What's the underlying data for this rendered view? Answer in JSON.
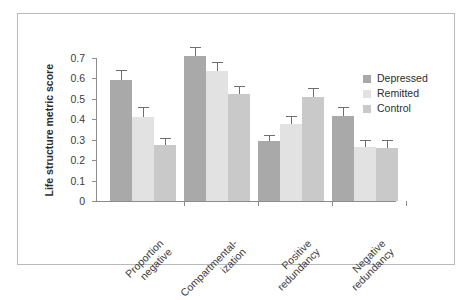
{
  "chart_data": {
    "type": "bar",
    "title": "",
    "xlabel": "",
    "ylabel": "Life structure metric score",
    "ylim": [
      0,
      0.75
    ],
    "grid": false,
    "legend_position": "right",
    "categories": [
      "Proportion negative",
      "Compartmental-ization",
      "Positive redundancy",
      "Negative redundancy"
    ],
    "category_lines": [
      [
        "Proportion",
        "negative"
      ],
      [
        "Compartmental-",
        "ization"
      ],
      [
        "Positive",
        "redundancy"
      ],
      [
        "Negative",
        "redundancy"
      ]
    ],
    "ytick_labels": [
      "0",
      "0.1",
      "0.2",
      "0.3",
      "0.4",
      "0.5",
      "0.6",
      "0.7"
    ],
    "ytick_values": [
      0,
      0.1,
      0.2,
      0.3,
      0.4,
      0.5,
      0.6,
      0.7
    ],
    "series": [
      {
        "name": "Depressed",
        "color": "#a9a9a9",
        "values": [
          0.59,
          0.71,
          0.295,
          0.415
        ],
        "errors": [
          0.045,
          0.04,
          0.025,
          0.04
        ]
      },
      {
        "name": "Remitted",
        "color": "#e2e2e2",
        "values": [
          0.41,
          0.635,
          0.375,
          0.265
        ],
        "errors": [
          0.045,
          0.04,
          0.035,
          0.03
        ]
      },
      {
        "name": "Control",
        "color": "#c9c9c9",
        "values": [
          0.275,
          0.525,
          0.51,
          0.26
        ],
        "errors": [
          0.03,
          0.035,
          0.04,
          0.035
        ]
      }
    ]
  },
  "legend": {
    "items": [
      {
        "label": "Depressed",
        "color": "#a9a9a9"
      },
      {
        "label": "Remitted",
        "color": "#e2e2e2"
      },
      {
        "label": "Control",
        "color": "#c9c9c9"
      }
    ]
  }
}
